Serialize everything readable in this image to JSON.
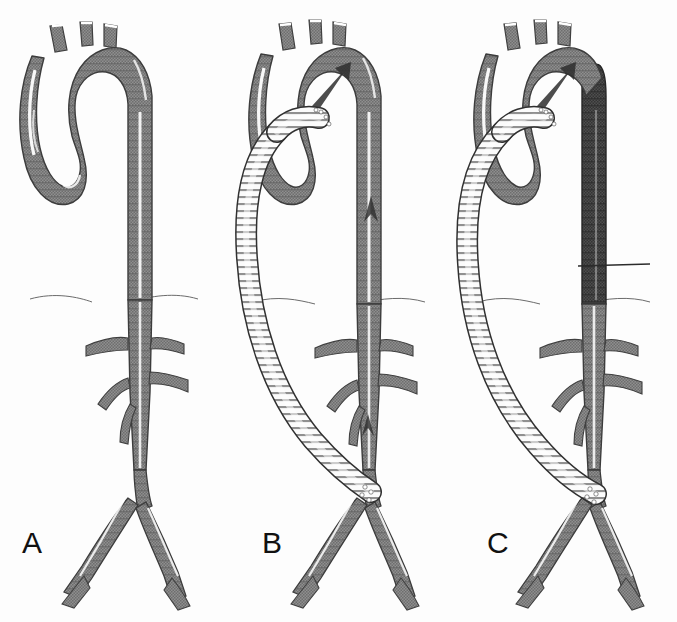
{
  "figure": {
    "type": "medical-illustration",
    "background_color": "#ffffff",
    "panel_count": 3
  },
  "colors": {
    "aorta_normal": "#8a8a8a",
    "aorta_normal_dark": "#6f6f6f",
    "aorta_excluded": "#4a4a4a",
    "aorta_excluded_dark": "#363636",
    "graft_fill": "#fbfbfb",
    "graft_rib": "#6a6a6a",
    "outline": "#3a3a3a",
    "highlight": "#ffffff",
    "arrow": "#2e2e2e",
    "label_text": "#111111",
    "diaphragm_line": "#5a5a5a",
    "suture": "#ffffff"
  },
  "panels": [
    {
      "id": "A",
      "label": "A",
      "label_x": 22,
      "label_y": 530,
      "caption": "Native aorta before repair: thoracic aorta, diaphragm, visceral branches and iliac bifurcation",
      "graft_present": false,
      "descending_aorta_shade": "normal",
      "arrows": [],
      "structures": [
        "ascending-aorta",
        "aortic-arch",
        "brachiocephalic-trunk",
        "left-common-carotid-artery",
        "left-subclavian-artery",
        "descending-thoracic-aorta",
        "diaphragm",
        "celiac-trunk",
        "superior-mesenteric-artery",
        "right-renal-artery",
        "left-renal-artery",
        "inferior-mesenteric-artery",
        "infrarenal-aorta",
        "aortic-bifurcation",
        "right-common-iliac-artery",
        "left-common-iliac-artery"
      ]
    },
    {
      "id": "B",
      "label": "B",
      "label_x": 262,
      "label_y": 530,
      "caption": "Bypass graft anastomosed proximally to ascending aorta and distally to distal abdominal aorta; flow still passes through native aorta",
      "graft_present": true,
      "descending_aorta_shade": "normal",
      "arrows": [
        {
          "name": "retrograde-arch-flow-arrow",
          "direction": "up-right",
          "location": "aortic-arch"
        },
        {
          "name": "descending-aorta-flow-arrow",
          "direction": "up",
          "location": "descending-thoracic-aorta"
        },
        {
          "name": "infrarenal-flow-arrow",
          "direction": "up",
          "location": "infrarenal-aorta"
        }
      ],
      "anastomoses": [
        {
          "name": "proximal-anastomosis",
          "site": "ascending-aorta"
        },
        {
          "name": "distal-anastomosis",
          "site": "distal-abdominal-aorta"
        }
      ]
    },
    {
      "id": "C",
      "label": "C",
      "label_x": 487,
      "label_y": 530,
      "caption": "Native descending thoracic aorta ligated and excluded (dark); all flow diverted through the bypass graft",
      "graft_present": true,
      "descending_aorta_shade": "excluded",
      "arrows": [
        {
          "name": "retrograde-arch-flow-arrow",
          "direction": "up-right",
          "location": "aortic-arch"
        }
      ],
      "ligature": {
        "name": "aortic-ligature-line",
        "location": "distal-descending-thoracic-aorta"
      },
      "anastomoses": [
        {
          "name": "proximal-anastomosis",
          "site": "ascending-aorta"
        },
        {
          "name": "distal-anastomosis",
          "site": "distal-abdominal-aorta"
        }
      ]
    }
  ]
}
